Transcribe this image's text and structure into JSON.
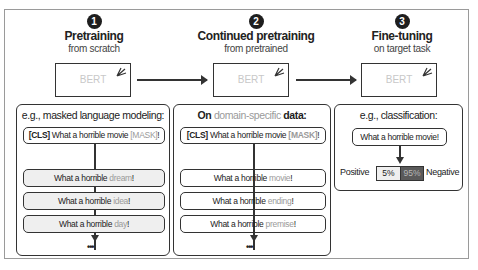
{
  "steps": [
    {
      "number": "1",
      "title": "Pretraining",
      "subtitle": "from scratch",
      "model": "BERT"
    },
    {
      "number": "2",
      "title": "Continued pretraining",
      "subtitle": "from pretrained",
      "model": "BERT"
    },
    {
      "number": "3",
      "title": "Fine-tuning",
      "subtitle": "on target task",
      "model": "BERT"
    }
  ],
  "panel1": {
    "title": "e.g., masked language modeling:",
    "input": {
      "cls": "[CLS]",
      "text": " What a horrible movie ",
      "mask": "[MASK]",
      "end": "!"
    },
    "outputs": [
      {
        "prefix": "What a horrible ",
        "word": "dream",
        "end": "!"
      },
      {
        "prefix": "What a horrible ",
        "word": "idea",
        "end": "!"
      },
      {
        "prefix": "What a horrible ",
        "word": "day",
        "end": "!"
      }
    ],
    "ellipsis": "•••"
  },
  "panel2": {
    "title_pre": "On ",
    "title_muted": "domain-specific",
    "title_post": " data:",
    "input": {
      "cls": "[CLS]",
      "text": " What a horrible movie ",
      "mask": "[MASK]",
      "end": "!"
    },
    "outputs": [
      {
        "prefix": "What a horrible ",
        "word": "movie",
        "end": "!"
      },
      {
        "prefix": "What a horrible ",
        "word": "ending",
        "end": "!"
      },
      {
        "prefix": "What a horrible ",
        "word": "premise",
        "end": "!"
      }
    ],
    "ellipsis": "•••"
  },
  "panel3": {
    "title": "e.g., classification:",
    "input": "What a horrible movie!",
    "positive_label": "Positive",
    "negative_label": "Negative",
    "positive_pct": "5%",
    "negative_pct": "95%"
  },
  "colors": {
    "stroke": "#333333",
    "muted": "#9a9a9a",
    "fill_gray": "#efefef",
    "negative_fill": "#5a5a5a"
  }
}
